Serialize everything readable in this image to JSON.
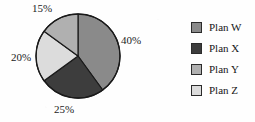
{
  "chart_data": {
    "type": "pie",
    "title": "",
    "subtitle": "",
    "xlabel": "",
    "ylabel": "",
    "grid": false,
    "legend_position": "right",
    "start_angle_deg": 0,
    "direction": "clockwise",
    "unit": "%",
    "categories": [
      "Plan W",
      "Plan X",
      "Plan Y",
      "Plan Z"
    ],
    "values": [
      40,
      25,
      15,
      20
    ],
    "data_labels": [
      "40%",
      "25%",
      "15%",
      "20%"
    ],
    "slice_colors": [
      "#8a8a8a",
      "#3d3d3d",
      "#b0b0b0",
      "#dcdcdc"
    ],
    "slice_order_clockwise_from_top": [
      "Plan W",
      "Plan X",
      "Plan Z",
      "Plan Y"
    ],
    "slices": [
      {
        "label": "Plan W",
        "value": 40,
        "data_label": "40%",
        "color": "#8a8a8a"
      },
      {
        "label": "Plan X",
        "value": 25,
        "data_label": "25%",
        "color": "#3d3d3d"
      },
      {
        "label": "Plan Y",
        "value": 15,
        "data_label": "15%",
        "color": "#b0b0b0"
      },
      {
        "label": "Plan Z",
        "value": 20,
        "data_label": "20%",
        "color": "#dcdcdc"
      }
    ]
  },
  "pie_labels": [
    {
      "text": "40%"
    },
    {
      "text": "25%"
    },
    {
      "text": "20%"
    },
    {
      "text": "15%"
    }
  ],
  "legend": {
    "items": [
      {
        "label": "Plan W",
        "color": "#8a8a8a"
      },
      {
        "label": "Plan X",
        "color": "#3d3d3d"
      },
      {
        "label": "Plan Y",
        "color": "#b0b0b0"
      },
      {
        "label": "Plan Z",
        "color": "#dcdcdc"
      }
    ]
  },
  "style": {
    "background": "#fefefe",
    "outline": "#1a1a1a",
    "text": "#161616"
  }
}
